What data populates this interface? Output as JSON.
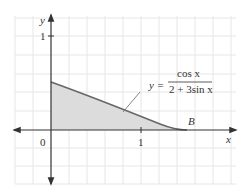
{
  "diagram": {
    "axes": {
      "x_label": "x",
      "y_label": "y",
      "origin_label": "0",
      "x_tick_label": "1",
      "y_tick_label": "1"
    },
    "curve": {
      "equation_prefix": "y =",
      "numerator": "cos x",
      "denominator": "2 + 3sin x"
    },
    "point_label": "B",
    "colors": {
      "grid": "#e4e4e4",
      "axis": "#333333",
      "curve": "#666666",
      "shade": "#dcdcdc"
    }
  }
}
